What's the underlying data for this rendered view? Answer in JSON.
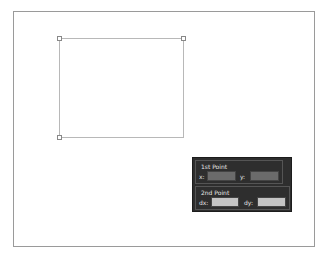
{
  "canvas": {
    "shape": {
      "type": "rectangle",
      "x1": 59,
      "y1": 38,
      "x2": 184,
      "y2": 138
    },
    "handles": [
      "top-left",
      "top-right",
      "bottom-left"
    ]
  },
  "panel": {
    "first_point": {
      "title": "1st Point",
      "x_label": "x:",
      "y_label": "y:",
      "x_value": "",
      "y_value": ""
    },
    "second_point": {
      "title": "2nd Point",
      "dx_label": "dx:",
      "dy_label": "dy:",
      "dx_value": "",
      "dy_value": ""
    }
  }
}
